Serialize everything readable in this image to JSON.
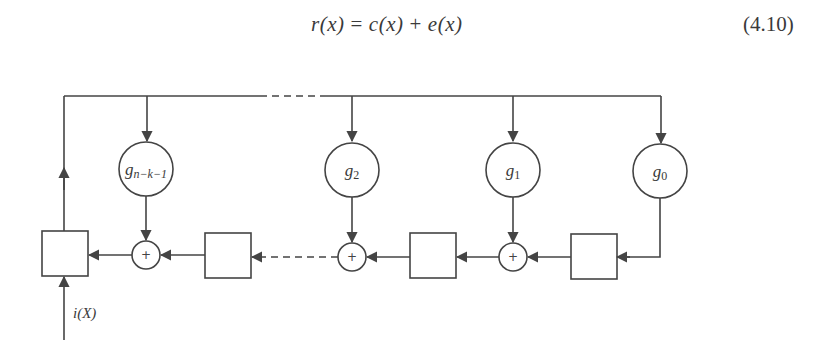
{
  "equation": {
    "lhs": "r(x)",
    "equals": "=",
    "term1": "c(x)",
    "plus": "+",
    "term2": "e(x)",
    "number": "(4.10)"
  },
  "diagram": {
    "type": "cyclic-encoder-shift-register",
    "coefficients": [
      {
        "label": "g",
        "sub": "n−k−1"
      },
      {
        "label": "g",
        "sub": "2"
      },
      {
        "label": "g",
        "sub": "1"
      },
      {
        "label": "g",
        "sub": "0"
      }
    ],
    "adder_symbol": "+",
    "input_label": "i(X)",
    "registers": 4,
    "line_color": "#444444"
  }
}
